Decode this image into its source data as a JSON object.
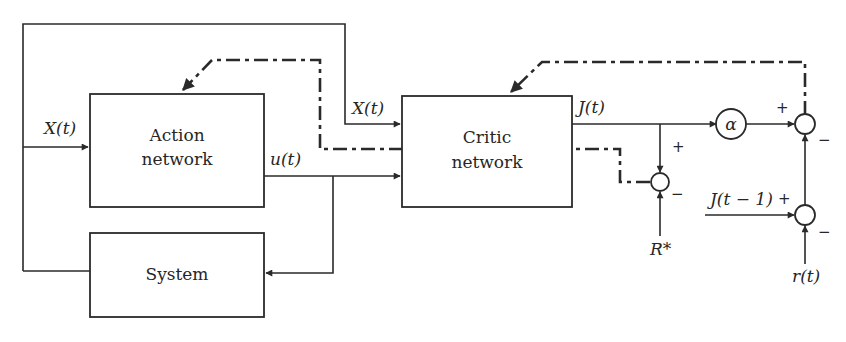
{
  "diagram": {
    "type": "block-diagram",
    "blocks": {
      "action": {
        "line1": "Action",
        "line2": "network"
      },
      "critic": {
        "line1": "Critic",
        "line2": "network"
      },
      "system": {
        "label": "System"
      },
      "alpha": {
        "label": "α"
      }
    },
    "signals": {
      "x_action": "X(t)",
      "x_critic": "X(t)",
      "u": "u(t)",
      "j": "J(t)",
      "j_prev": "J(t − 1)",
      "r": "r(t)",
      "r_star": "R*"
    },
    "signs": {
      "junction_r_top": "+",
      "junction_r_bottom": "−",
      "junction_main_left": "+",
      "junction_main_bottom": "−",
      "junction_lower_left": "+",
      "junction_lower_bottom": "−"
    },
    "colors": {
      "line": "#2a2a2a",
      "text": "#262626",
      "background": "#ffffff"
    }
  }
}
